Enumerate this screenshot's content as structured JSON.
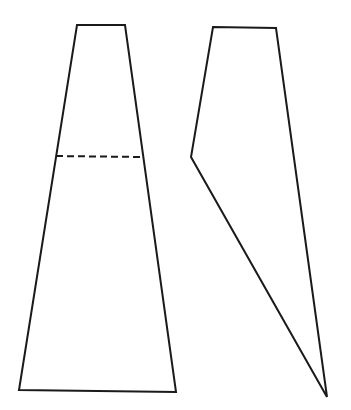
{
  "canvas": {
    "width": 351,
    "height": 410,
    "background": "#ffffff"
  },
  "stroke": {
    "color": "#1a1a1a",
    "width": 2,
    "dash": "7,4"
  },
  "shapes": {
    "left_trapezoid": {
      "points": "77,25 125,25 176,392 19,390"
    },
    "left_dashed_line": {
      "x1": 56,
      "y1": 156,
      "x2": 143,
      "y2": 157
    },
    "right_polygon": {
      "points": "213,27 276,28 327,397 191,157"
    }
  }
}
